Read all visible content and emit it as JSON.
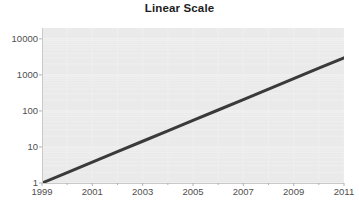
{
  "chart_data": {
    "type": "line",
    "title": "Linear Scale",
    "xlabel": "",
    "ylabel": "",
    "yscale": "log",
    "xscale": "linear",
    "grid": true,
    "legend": false,
    "legend_position": "none",
    "xlim": [
      1999,
      2011
    ],
    "ylim": [
      1,
      20000
    ],
    "x_tick_labels": [
      "1999",
      "2001",
      "2003",
      "2005",
      "2007",
      "2009",
      "2011"
    ],
    "x_tick_values": [
      1999,
      2001,
      2003,
      2005,
      2007,
      2009,
      2011
    ],
    "x_minor_tick_values": [
      2000,
      2002,
      2004,
      2006,
      2008,
      2010
    ],
    "y_tick_labels": [
      "10000",
      "1000",
      "100",
      "10",
      "1"
    ],
    "y_tick_values": [
      10000,
      1000,
      100,
      10,
      1
    ],
    "series": [
      {
        "name": "Exponential growth",
        "color": "#3a3a3a",
        "line_width": 3,
        "x": [
          1999,
          2000,
          2001,
          2002,
          2003,
          2004,
          2005,
          2006,
          2007,
          2008,
          2009,
          2010,
          2011
        ],
        "values": [
          1,
          1.95,
          3.8,
          7.4,
          14.4,
          28,
          54.6,
          106,
          207,
          404,
          786,
          1532,
          2985
        ]
      }
    ],
    "annotations": []
  },
  "colors": {
    "page_background": "#ffffff",
    "plot_background": "#eaeaea",
    "gridline": "#f2f2f2",
    "axis_line": "#c9c9c9",
    "tick_mark": "#b8b8b8",
    "tick_label": "#4f4f4f",
    "title": "#1d1d1d",
    "series_line": "#3a3a3a"
  }
}
